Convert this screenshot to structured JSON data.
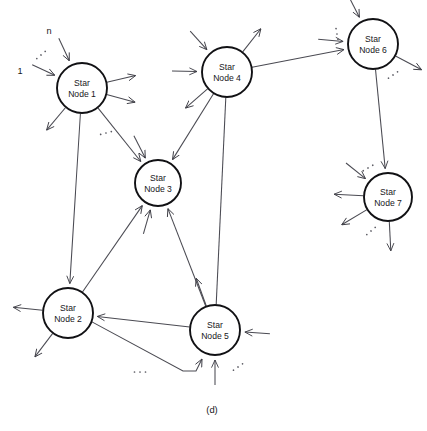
{
  "figure": {
    "caption": "(d)",
    "caption_position": {
      "x": 212,
      "y": 411
    },
    "width": 427,
    "height": 431,
    "background_color": "#ffffff",
    "node_stroke_color": "#111114",
    "edge_stroke_color": "#4a4a52",
    "node_fill_color": "#ffffff"
  },
  "nodes": [
    {
      "id": "node1",
      "line1": "Star",
      "line2": "Node 1",
      "cx": 82,
      "cy": 88,
      "r": 25
    },
    {
      "id": "node2",
      "line1": "Star",
      "line2": "Node 2",
      "cx": 68,
      "cy": 313,
      "r": 25
    },
    {
      "id": "node3",
      "line1": "Star",
      "line2": "Node 3",
      "cx": 158,
      "cy": 183,
      "r": 23
    },
    {
      "id": "node4",
      "line1": "Star",
      "line2": "Node 4",
      "cx": 227,
      "cy": 72,
      "r": 25
    },
    {
      "id": "node5",
      "line1": "Star",
      "line2": "Node 5",
      "cx": 215,
      "cy": 330,
      "r": 25
    },
    {
      "id": "node6",
      "line1": "Star",
      "line2": "Node 6",
      "cx": 373,
      "cy": 44,
      "r": 25
    },
    {
      "id": "node7",
      "line1": "Star",
      "line2": "Node 7",
      "cx": 388,
      "cy": 197,
      "r": 24
    }
  ],
  "port_labels": [
    {
      "id": "port-n",
      "text": "n",
      "x": 49,
      "y": 32
    },
    {
      "id": "port-1",
      "text": "1",
      "x": 20,
      "y": 72
    }
  ],
  "internal_edges": [
    {
      "id": "edge-node1-node3",
      "from": "node1",
      "to": "node3",
      "arrow": "end"
    },
    {
      "id": "edge-node1-node2",
      "from": "node1",
      "to": "node2",
      "arrow": "end"
    },
    {
      "id": "edge-node4-node3",
      "from": "node4",
      "to": "node3",
      "arrow": "end"
    },
    {
      "id": "edge-node4-node6",
      "from": "node4",
      "to": "node6",
      "arrow": "end"
    },
    {
      "id": "edge-node5-node4",
      "from": "node5",
      "to": "node4",
      "arrow": "none"
    },
    {
      "id": "edge-node5-node3",
      "from": "node5",
      "to": "node3",
      "arrow": "end"
    },
    {
      "id": "edge-node5-node2",
      "from": "node5",
      "to": "node2",
      "arrow": "end"
    },
    {
      "id": "edge-node2-node5",
      "from": "node2",
      "to": "node5",
      "arrow": "end",
      "routed": true
    },
    {
      "id": "edge-node2-node3",
      "from": "node2",
      "to": "node3",
      "arrow": "end"
    },
    {
      "id": "edge-node6-node7",
      "from": "node6",
      "to": "node7",
      "arrow": "end"
    }
  ],
  "external_stubs": [
    {
      "id": "stub-node1-in-n",
      "node": "node1",
      "direction": "in",
      "angle": 245
    },
    {
      "id": "stub-node1-in-1",
      "node": "node1",
      "direction": "in",
      "angle": 205
    },
    {
      "id": "stub-node1-out-e1",
      "node": "node1",
      "direction": "out",
      "angle": 15
    },
    {
      "id": "stub-node1-out-e2",
      "node": "node1",
      "direction": "out",
      "angle": 347
    },
    {
      "id": "stub-node1-out-sw",
      "node": "node1",
      "direction": "out",
      "angle": 130
    },
    {
      "id": "stub-node2-out-w",
      "node": "node2",
      "direction": "out",
      "angle": 186
    },
    {
      "id": "stub-node2-out-sw",
      "node": "node2",
      "direction": "out",
      "angle": 127
    },
    {
      "id": "stub-node3-in-n1",
      "node": "node3",
      "direction": "in",
      "angle": 243
    },
    {
      "id": "stub-node3-in-s1",
      "node": "node3",
      "direction": "in",
      "angle": 106
    },
    {
      "id": "stub-node4-in-nw",
      "node": "node4",
      "direction": "in",
      "angle": 228
    },
    {
      "id": "stub-node4-out-ne",
      "node": "node4",
      "direction": "out",
      "angle": 308
    },
    {
      "id": "stub-node4-in-w",
      "node": "node4",
      "direction": "in",
      "angle": 181
    },
    {
      "id": "stub-node4-out-sw",
      "node": "node4",
      "direction": "out",
      "angle": 139
    },
    {
      "id": "stub-node5-in-e",
      "node": "node5",
      "direction": "in",
      "angle": 4
    },
    {
      "id": "stub-node5-in-s",
      "node": "node5",
      "direction": "in",
      "angle": 90
    },
    {
      "id": "stub-node5-out-nw",
      "node": "node5",
      "direction": "out",
      "angle": 250
    },
    {
      "id": "stub-node6-in-nw",
      "node": "node6",
      "direction": "in",
      "angle": 243
    },
    {
      "id": "stub-node6-in-w",
      "node": "node6",
      "direction": "in",
      "angle": 185
    },
    {
      "id": "stub-node6-out-se",
      "node": "node6",
      "direction": "out",
      "angle": 28
    },
    {
      "id": "stub-node7-in-nw",
      "node": "node7",
      "direction": "in",
      "angle": 219
    },
    {
      "id": "stub-node7-out-w",
      "node": "node7",
      "direction": "out",
      "angle": 183
    },
    {
      "id": "stub-node7-out-sw",
      "node": "node7",
      "direction": "out",
      "angle": 149
    },
    {
      "id": "stub-node7-out-s",
      "node": "node7",
      "direction": "out",
      "angle": 87
    }
  ],
  "ellipses_marks": [
    {
      "id": "ellipsis-node1-in",
      "x": 41,
      "y": 55,
      "angle": -40
    },
    {
      "id": "ellipsis-node1-out",
      "x": 106,
      "y": 133,
      "angle": -15
    },
    {
      "id": "ellipsis-node4-node6",
      "x": 337,
      "y": 34,
      "angle": 80
    },
    {
      "id": "ellipsis-node6-out",
      "x": 393,
      "y": 75,
      "angle": -35
    },
    {
      "id": "ellipsis-node7-in",
      "x": 368,
      "y": 168,
      "angle": -30
    },
    {
      "id": "ellipsis-node7-out",
      "x": 371,
      "y": 231,
      "angle": -40
    },
    {
      "id": "ellipsis-node5-out",
      "x": 238,
      "y": 367,
      "angle": -35
    },
    {
      "id": "ellipsis-node2-node5",
      "x": 140,
      "y": 372,
      "angle": 0
    }
  ]
}
